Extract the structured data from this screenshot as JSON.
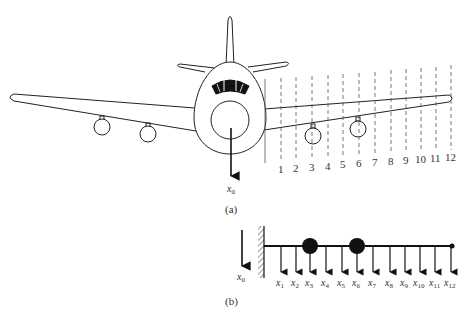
{
  "figure": {
    "panel_a": {
      "caption": "(a)",
      "base_label": "x",
      "base_sub": "0",
      "section_numbers": [
        "1",
        "2",
        "3",
        "4",
        "5",
        "6",
        "7",
        "8",
        "9",
        "10",
        "11",
        "12"
      ]
    },
    "panel_b": {
      "caption": "(b)",
      "base_label": "x",
      "base_sub": "0",
      "node_labels": [
        {
          "v": "x",
          "s": "1"
        },
        {
          "v": "x",
          "s": "2"
        },
        {
          "v": "x",
          "s": "3"
        },
        {
          "v": "x",
          "s": "4"
        },
        {
          "v": "x",
          "s": "5"
        },
        {
          "v": "x",
          "s": "6"
        },
        {
          "v": "x",
          "s": "7"
        },
        {
          "v": "x",
          "s": "8"
        },
        {
          "v": "x",
          "s": "9"
        },
        {
          "v": "x",
          "s": "10"
        },
        {
          "v": "x",
          "s": "11"
        },
        {
          "v": "x",
          "s": "12"
        }
      ],
      "lumped_masses_at": [
        "3",
        "6"
      ]
    },
    "colors": {
      "line": "#222222",
      "dashed": "#555555",
      "fill": "#111111"
    }
  }
}
